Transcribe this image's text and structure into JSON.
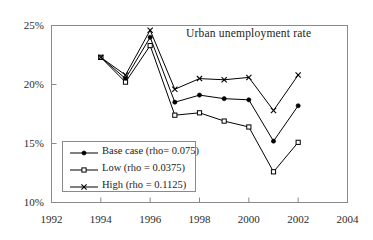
{
  "chart_data": {
    "type": "line",
    "title": "Urban unemployment rate",
    "xlabel": "",
    "ylabel": "",
    "x": [
      1994,
      1995,
      1996,
      1997,
      1998,
      1999,
      2000,
      2001,
      2002
    ],
    "xlim": [
      1992,
      2004
    ],
    "ylim": [
      10,
      25
    ],
    "xticks": [
      1992,
      1994,
      1996,
      1998,
      2000,
      2002,
      2004
    ],
    "xtick_labels": [
      "1992",
      "1994",
      "1996",
      "1998",
      "2000",
      "2002",
      "2004"
    ],
    "yticks": [
      10,
      15,
      20,
      25
    ],
    "ytick_labels": [
      "10%",
      "15%",
      "20%",
      "25%"
    ],
    "grid": false,
    "legend_position": "lower-left",
    "series": [
      {
        "name": "Base case (rho= 0.075)",
        "marker": "filled-diamond",
        "color": "#000000",
        "values": [
          22.3,
          20.5,
          24.0,
          18.5,
          19.1,
          18.8,
          18.7,
          15.2,
          18.2
        ]
      },
      {
        "name": "Low (rho = 0.0375)",
        "marker": "open-square",
        "color": "#000000",
        "values": [
          22.3,
          20.2,
          23.3,
          17.4,
          17.6,
          16.9,
          16.4,
          12.6,
          15.1
        ]
      },
      {
        "name": "High (rho = 0.1125)",
        "marker": "x-cross",
        "color": "#000000",
        "values": [
          22.3,
          20.8,
          24.6,
          19.6,
          20.5,
          20.4,
          20.6,
          17.8,
          20.8
        ]
      }
    ]
  },
  "axis": {
    "line_color": "#8a8a8a",
    "label_color": "#2b2b2b"
  }
}
